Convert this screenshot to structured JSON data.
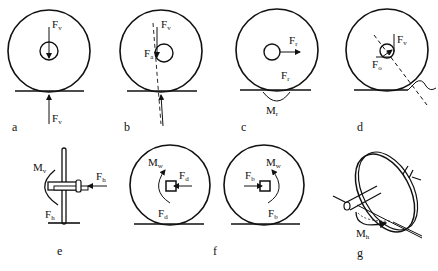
{
  "figure": {
    "panels": [
      {
        "id": "a",
        "caption": "a",
        "labels": [
          {
            "main": "F",
            "sub": "v"
          },
          {
            "main": "F",
            "sub": "v"
          }
        ]
      },
      {
        "id": "b",
        "caption": "b",
        "labels": [
          {
            "main": "F",
            "sub": "v"
          },
          {
            "main": "F",
            "sub": "a"
          }
        ]
      },
      {
        "id": "c",
        "caption": "c",
        "labels": [
          {
            "main": "F",
            "sub": "r"
          },
          {
            "main": "F",
            "sub": "r"
          },
          {
            "main": "M",
            "sub": "r"
          }
        ]
      },
      {
        "id": "d",
        "caption": "d",
        "labels": [
          {
            "main": "F",
            "sub": "v"
          },
          {
            "main": "F",
            "sub": "o"
          }
        ]
      },
      {
        "id": "e",
        "caption": "e",
        "labels": [
          {
            "main": "M",
            "sub": "v"
          },
          {
            "main": "F",
            "sub": "h"
          },
          {
            "main": "F",
            "sub": "h"
          }
        ]
      },
      {
        "id": "f",
        "caption": "f",
        "labels": [
          {
            "main": "M",
            "sub": "w"
          },
          {
            "main": "F",
            "sub": "d"
          },
          {
            "main": "F",
            "sub": "d"
          },
          {
            "main": "F",
            "sub": "b"
          },
          {
            "main": "M",
            "sub": "w"
          },
          {
            "main": "F",
            "sub": "b"
          }
        ]
      },
      {
        "id": "g",
        "caption": "g",
        "labels": [
          {
            "main": "M",
            "sub": "h"
          }
        ]
      }
    ]
  }
}
